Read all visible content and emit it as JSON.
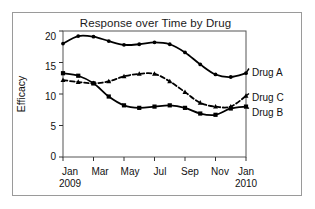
{
  "chart_data": {
    "type": "line",
    "title": "Response over Time by Drug",
    "xlabel": "",
    "ylabel": "Efficacy",
    "ylim": [
      0,
      20
    ],
    "yticks": [
      0,
      5,
      10,
      15,
      20
    ],
    "grid": false,
    "legend_position": "right-inline",
    "x": [
      "Jan 2009",
      "Feb 2009",
      "Mar 2009",
      "Apr 2009",
      "May 2009",
      "Jun 2009",
      "Jul 2009",
      "Aug 2009",
      "Sep 2009",
      "Oct 2009",
      "Nov 2009",
      "Dec 2009",
      "Jan 2010"
    ],
    "xtick_labels": [
      "Jan",
      "Mar",
      "May",
      "Jul",
      "Sep",
      "Nov",
      "Jan"
    ],
    "xtick_sublabels": [
      "2009",
      "",
      "",
      "",
      "",
      "",
      "2010"
    ],
    "xtick_values": [
      "Jan 2009",
      "Mar 2009",
      "May 2009",
      "Jul 2009",
      "Sep 2009",
      "Nov 2009",
      "Jan 2010"
    ],
    "series": [
      {
        "name": "Drug A",
        "marker": "circle",
        "line": "solid",
        "color": "#000000",
        "values": [
          18.0,
          19.2,
          19.1,
          18.4,
          17.8,
          17.9,
          18.2,
          17.9,
          16.6,
          14.7,
          13.1,
          12.7,
          13.3
        ]
      },
      {
        "name": "Drug B",
        "marker": "square",
        "line": "solid",
        "color": "#000000",
        "values": [
          13.3,
          12.9,
          11.7,
          9.6,
          8.2,
          7.8,
          8.0,
          8.2,
          7.8,
          6.9,
          6.7,
          7.7,
          8.0
        ]
      },
      {
        "name": "Drug C",
        "marker": "triangle",
        "line": "dashed",
        "color": "#000000",
        "values": [
          12.2,
          11.9,
          11.7,
          12.0,
          12.8,
          13.2,
          13.2,
          12.0,
          10.3,
          8.6,
          8.0,
          8.0,
          9.7
        ]
      }
    ]
  },
  "labels": {
    "drug_a": "Drug A",
    "drug_c": "Drug C",
    "drug_b": "Drug B"
  },
  "axis": {
    "y0": "0",
    "y5": "5",
    "y10": "10",
    "y15": "15",
    "y20": "20",
    "x_jan09": "Jan",
    "x_mar": "Mar",
    "x_may": "May",
    "x_jul": "Jul",
    "x_sep": "Sep",
    "x_nov": "Nov",
    "x_jan10": "Jan",
    "year_2009": "2009",
    "year_2010": "2010"
  }
}
